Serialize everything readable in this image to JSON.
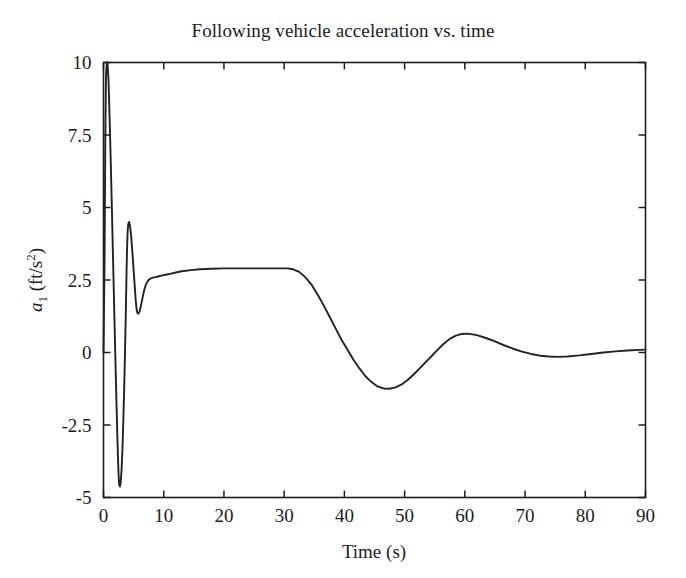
{
  "chart_data": {
    "type": "line",
    "title": "Following vehicle acceleration vs. time",
    "xlabel": "Time (s)",
    "ylabel": "a_1 (ft/s^2)",
    "ylabel_parts": {
      "symbol": "a",
      "subscript": "1",
      "units_open": " (ft/s",
      "superscript": "2",
      "units_close": ")"
    },
    "xlim": [
      0,
      90
    ],
    "ylim": [
      -5,
      10
    ],
    "xticks": [
      0,
      10,
      20,
      30,
      40,
      50,
      60,
      70,
      80,
      90
    ],
    "xtick_labels": [
      "0",
      "10",
      "20",
      "30",
      "40",
      "50",
      "60",
      "70",
      "80",
      "90"
    ],
    "yticks": [
      -5,
      -2.5,
      0,
      2.5,
      5,
      7.5,
      10
    ],
    "ytick_labels": [
      "-5",
      "-2.5",
      "0",
      "2.5",
      "5",
      "7.5",
      "10"
    ],
    "grid": false,
    "legend": null,
    "line_color": "#222222",
    "background_color": "#ffffff",
    "axis_color": "#1c1c1c",
    "series": [
      {
        "name": "a1",
        "x": [
          0,
          0.18,
          0.3,
          0.42,
          0.55,
          0.62,
          0.7,
          0.85,
          1.0,
          1.2,
          1.4,
          1.6,
          1.8,
          1.95,
          2.1,
          2.25,
          2.4,
          2.5,
          2.6,
          2.72,
          2.85,
          3.0,
          3.15,
          3.3,
          3.45,
          3.6,
          3.72,
          3.82,
          3.9,
          4.0,
          4.1,
          4.25,
          4.4,
          4.6,
          4.8,
          5.0,
          5.2,
          5.35,
          5.5,
          5.65,
          5.8,
          6.0,
          6.2,
          6.45,
          6.7,
          7.0,
          7.4,
          7.8,
          8.2,
          8.7,
          9.2,
          9.8,
          10.5,
          11.2,
          12.0,
          13.0,
          14.5,
          16.0,
          18.0,
          20.0,
          23.0,
          26.0,
          29.0,
          30.5,
          31.5,
          32.5,
          33.5,
          34.5,
          35.5,
          36.5,
          37.5,
          38.5,
          39.5,
          40.5,
          41.5,
          42.5,
          43.5,
          44.5,
          45.5,
          46.5,
          47.5,
          48.5,
          49.5,
          50.5,
          51.5,
          52.5,
          53.5,
          54.5,
          55.5,
          56.5,
          57.5,
          58.5,
          59.5,
          60.5,
          62.0,
          63.5,
          65.0,
          66.5,
          68.0,
          69.5,
          71.0,
          72.5,
          74.0,
          75.5,
          77.0,
          79.0,
          81.0,
          83.0,
          85.0,
          87.0,
          89.0,
          90.0
        ],
        "y": [
          0,
          3.2,
          7.4,
          9.6,
          10.0,
          10.0,
          9.9,
          9.3,
          8.2,
          6.6,
          4.9,
          3.1,
          1.3,
          0.0,
          -1.3,
          -2.5,
          -3.6,
          -4.2,
          -4.55,
          -4.62,
          -4.5,
          -4.05,
          -3.3,
          -2.3,
          -1.1,
          0.3,
          1.5,
          2.7,
          3.5,
          4.15,
          4.42,
          4.5,
          4.38,
          4.0,
          3.45,
          2.85,
          2.25,
          1.8,
          1.48,
          1.35,
          1.34,
          1.42,
          1.6,
          1.85,
          2.1,
          2.32,
          2.48,
          2.55,
          2.58,
          2.6,
          2.63,
          2.66,
          2.69,
          2.72,
          2.76,
          2.8,
          2.84,
          2.87,
          2.89,
          2.9,
          2.9,
          2.9,
          2.9,
          2.9,
          2.87,
          2.78,
          2.6,
          2.35,
          2.02,
          1.65,
          1.25,
          0.85,
          0.45,
          0.1,
          -0.25,
          -0.55,
          -0.82,
          -1.02,
          -1.17,
          -1.24,
          -1.25,
          -1.2,
          -1.1,
          -0.95,
          -0.76,
          -0.55,
          -0.33,
          -0.12,
          0.1,
          0.3,
          0.47,
          0.58,
          0.64,
          0.65,
          0.6,
          0.5,
          0.38,
          0.25,
          0.13,
          0.03,
          -0.05,
          -0.11,
          -0.14,
          -0.15,
          -0.14,
          -0.1,
          -0.05,
          0.0,
          0.04,
          0.07,
          0.09,
          0.1
        ]
      }
    ],
    "annotations": {
      "initial_spike_peak": 10.0,
      "first_undershoot": -4.62,
      "second_overshoot": 4.5,
      "steady_plateau": 2.9,
      "plateau_end_time": 31,
      "main_dip_min": -1.25,
      "main_dip_time": 45,
      "recovery_peak": 0.65,
      "recovery_peak_time": 58,
      "final_value": 0.1
    }
  }
}
